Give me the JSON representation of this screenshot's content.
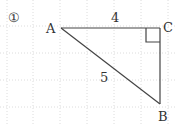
{
  "problem_number": "①",
  "vertices": {
    "A": "A",
    "B": "B",
    "C": "C"
  },
  "side_labels": {
    "AC": "4",
    "AB": "5"
  },
  "colors": {
    "line": "#444444",
    "grid": "#d8d8d8",
    "text": "#333333"
  }
}
